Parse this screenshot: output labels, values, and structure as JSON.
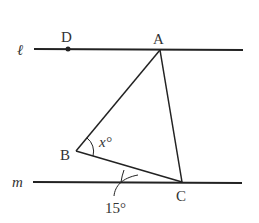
{
  "figure": {
    "lines": {
      "l": {
        "label": "ℓ"
      },
      "m": {
        "label": "m"
      }
    },
    "points": {
      "D": {
        "label": "D"
      },
      "A": {
        "label": "A"
      },
      "B": {
        "label": "B"
      },
      "C": {
        "label": "C"
      }
    },
    "angles": {
      "x": {
        "label": "x°"
      },
      "given": {
        "label": "15°"
      }
    },
    "colors": {
      "stroke": "#222222",
      "text": "#333333"
    }
  }
}
